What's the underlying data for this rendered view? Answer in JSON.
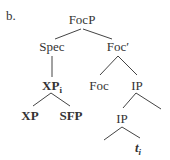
{
  "label": "b.",
  "nodes": {
    "focp": "FocP",
    "spec": "Spec",
    "focbar": "Foc′",
    "xpi_base": "XP",
    "xpi_sub": "i",
    "foc": "Foc",
    "ip1": "IP",
    "xp": "XP",
    "sfp": "SFP",
    "ip2": "IP",
    "trace_base": "t",
    "trace_sub": "i"
  },
  "colors": {
    "text": "#333333",
    "lines": "#444444",
    "background": "#ffffff"
  }
}
